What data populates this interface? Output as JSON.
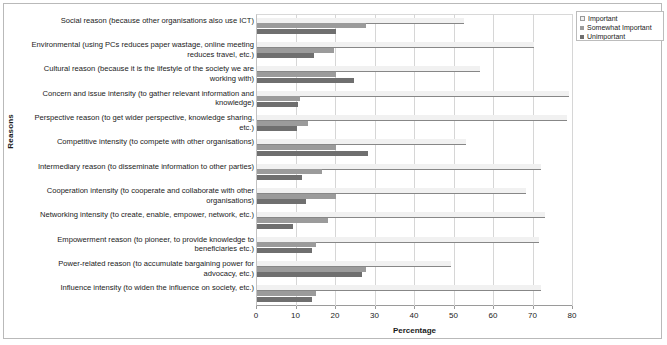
{
  "chart_data": {
    "type": "bar",
    "orientation": "horizontal",
    "title": "",
    "xlabel": "Percentage",
    "ylabel": "Reasons",
    "xlim": [
      0,
      80
    ],
    "xticks": [
      0,
      10,
      20,
      30,
      40,
      50,
      60,
      70,
      80
    ],
    "grid": true,
    "legend_position": "top-right",
    "categories": [
      "Social reason (because other organisations also use ICT)",
      "Environmental (using PCs reduces paper wastage, online meeting reduces travel, etc.)",
      "Cultural reason (because it is the lifestyle of the society we are working with)",
      "Concern and issue intensity (to gather relevant information and knowledge)",
      "Perspective reason (to get wider perspective, knowledge sharing, etc.)",
      "Competitive intensity (to compete with other organisations)",
      "Intermediary reason (to disseminate information to other parties)",
      "Cooperation intensity (to cooperate and collaborate with other organisations)",
      "Networking intensity (to create, enable, empower, network, etc.)",
      "Empowerment reason (to pioneer, to provide knowledge to beneficiaries etc.)",
      "Power-related reason (to accumulate bargaining power for advocacy, etc.)",
      "Influence intensity (to widen the influence on society, etc.)"
    ],
    "series": [
      {
        "name": "Important",
        "color": "#f1f1f1",
        "values": [
          52.5,
          70.0,
          56.5,
          79.0,
          78.5,
          53.0,
          72.0,
          68.0,
          73.0,
          71.5,
          49.0,
          72.0
        ]
      },
      {
        "name": "Somewhat Important",
        "color": "#9b9b9b",
        "values": [
          27.5,
          19.5,
          20.0,
          11.0,
          13.0,
          20.0,
          16.5,
          20.0,
          18.0,
          15.0,
          27.5,
          15.0
        ]
      },
      {
        "name": "Unimportant",
        "color": "#6f6f6f",
        "values": [
          20.0,
          14.5,
          24.5,
          10.5,
          10.0,
          28.0,
          11.5,
          12.5,
          9.0,
          14.0,
          26.5,
          14.0
        ]
      }
    ]
  },
  "axes": {
    "x_title": "Percentage",
    "y_title": "Reasons",
    "x_tick_labels": [
      "0",
      "10",
      "20",
      "30",
      "40",
      "50",
      "60",
      "70",
      "80"
    ]
  },
  "legend": {
    "items": [
      {
        "label": "Important",
        "color": "#f1f1f1"
      },
      {
        "label": "Somewhat Important",
        "color": "#9b9b9b"
      },
      {
        "label": "Unimportant",
        "color": "#6f6f6f"
      }
    ]
  }
}
